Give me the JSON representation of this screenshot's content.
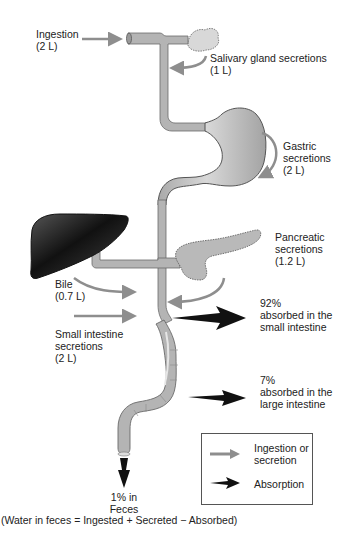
{
  "diagram": {
    "colors": {
      "tract": "#b4b4b4",
      "tract_outline": "#6a6a6a",
      "secretion_arrow": "#8e8e8e",
      "absorption_arrow": "#111111",
      "liver": "#2a2a2a"
    },
    "inputs": [
      {
        "id": "ingestion",
        "lines": [
          "Ingestion",
          "(2 L)"
        ]
      },
      {
        "id": "salivary",
        "lines": [
          "Salivary gland secretions",
          "(1 L)"
        ]
      },
      {
        "id": "gastric",
        "lines": [
          "Gastric",
          "secretions",
          "(2 L)"
        ]
      },
      {
        "id": "pancreatic",
        "lines": [
          "Pancreatic",
          "secretions",
          "(1.2 L)"
        ]
      },
      {
        "id": "bile",
        "lines": [
          "Bile",
          "(0.7 L)"
        ]
      },
      {
        "id": "small-intestine-secretions",
        "lines": [
          "Small intestine",
          "secretions",
          "(2 L)"
        ]
      }
    ],
    "outputs": [
      {
        "id": "small-intestine-absorption",
        "lines": [
          "92%",
          "absorbed in the",
          "small intestine"
        ]
      },
      {
        "id": "large-intestine-absorption",
        "lines": [
          "7%",
          "absorbed in the",
          "large intestine"
        ]
      },
      {
        "id": "feces",
        "lines": [
          "1% in",
          "Feces"
        ]
      }
    ],
    "equation": "(Water in feces = Ingested + Secreted − Absorbed)",
    "legend": {
      "items": [
        {
          "icon": "gray-arrow-icon",
          "lines": [
            "Ingestion or",
            "secretion"
          ]
        },
        {
          "icon": "black-arrow-icon",
          "lines": [
            "Absorption"
          ]
        }
      ]
    },
    "organs": [
      "mouth",
      "salivary gland",
      "esophagus",
      "stomach",
      "liver",
      "pancreas",
      "small intestine",
      "large intestine"
    ]
  }
}
